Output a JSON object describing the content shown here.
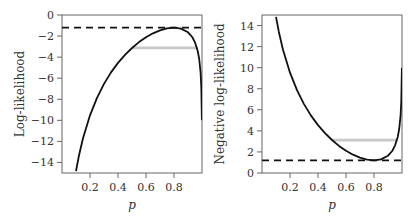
{
  "chart_data": [
    {
      "type": "line",
      "title": "",
      "xlabel": "p",
      "ylabel": "Log-likelihood",
      "xlim": [
        0,
        1
      ],
      "ylim": [
        -15,
        0
      ],
      "xticks": [
        0.2,
        0.4,
        0.6,
        0.8
      ],
      "xtick_labels": [
        "0.2",
        "0.4",
        "0.6",
        "0.8"
      ],
      "yticks": [
        0,
        -2,
        -4,
        -6,
        -8,
        -10,
        -12,
        -14
      ],
      "ytick_labels": [
        "0",
        "−2",
        "−4",
        "−6",
        "−8",
        "−10",
        "−12",
        "−14"
      ],
      "grid": false,
      "series": [
        {
          "name": "log-likelihood curve",
          "style": "solid",
          "color": "#111111",
          "x": [
            0.1,
            0.12,
            0.15,
            0.2,
            0.25,
            0.3,
            0.35,
            0.4,
            0.45,
            0.5,
            0.55,
            0.6,
            0.65,
            0.7,
            0.75,
            0.8,
            0.85,
            0.9,
            0.93,
            0.95,
            0.97,
            0.98,
            0.99,
            0.995,
            0.999
          ],
          "y": [
            -14.83,
            -13.41,
            -11.7,
            -9.52,
            -7.86,
            -6.54,
            -5.45,
            -4.55,
            -3.78,
            -3.13,
            -2.57,
            -2.11,
            -1.74,
            -1.46,
            -1.27,
            -1.2,
            -1.29,
            -1.64,
            -2.09,
            -2.6,
            -3.45,
            -4.18,
            -5.48,
            -6.83,
            -10.0
          ]
        },
        {
          "name": "maximum log-likelihood",
          "style": "dashed",
          "color": "#111111",
          "x": [
            0,
            1
          ],
          "y": [
            -1.2,
            -1.2
          ]
        },
        {
          "name": "95% interval",
          "style": "solid",
          "color": "#c8c8c8",
          "x": [
            0.5,
            0.97
          ],
          "y": [
            -3.12,
            -3.12
          ]
        }
      ]
    },
    {
      "type": "line",
      "title": "",
      "xlabel": "p",
      "ylabel": "Negative log-likelihood",
      "xlim": [
        0,
        1
      ],
      "ylim": [
        0,
        15
      ],
      "xticks": [
        0.2,
        0.4,
        0.6,
        0.8
      ],
      "xtick_labels": [
        "0.2",
        "0.4",
        "0.6",
        "0.8"
      ],
      "yticks": [
        0,
        2,
        4,
        6,
        8,
        10,
        12,
        14
      ],
      "ytick_labels": [
        "0",
        "2",
        "4",
        "6",
        "8",
        "10",
        "12",
        "14"
      ],
      "grid": false,
      "series": [
        {
          "name": "negative log-likelihood curve",
          "style": "solid",
          "color": "#111111",
          "x": [
            0.1,
            0.12,
            0.15,
            0.2,
            0.25,
            0.3,
            0.35,
            0.4,
            0.45,
            0.5,
            0.55,
            0.6,
            0.65,
            0.7,
            0.75,
            0.8,
            0.85,
            0.9,
            0.93,
            0.95,
            0.97,
            0.98,
            0.99,
            0.995,
            0.999
          ],
          "y": [
            14.83,
            13.41,
            11.7,
            9.52,
            7.86,
            6.54,
            5.45,
            4.55,
            3.78,
            3.13,
            2.57,
            2.11,
            1.74,
            1.46,
            1.27,
            1.2,
            1.29,
            1.64,
            2.09,
            2.6,
            3.45,
            4.18,
            5.48,
            6.83,
            10.0
          ]
        },
        {
          "name": "minimum negative log-likelihood",
          "style": "dashed",
          "color": "#111111",
          "x": [
            0,
            1
          ],
          "y": [
            1.2,
            1.2
          ]
        },
        {
          "name": "95% interval",
          "style": "solid",
          "color": "#c8c8c8",
          "x": [
            0.5,
            0.97
          ],
          "y": [
            3.12,
            3.12
          ]
        }
      ]
    }
  ],
  "panels": [
    {
      "ylabel": "Log-likelihood",
      "xlabel": "p"
    },
    {
      "ylabel": "Negative log-likelihood",
      "xlabel": "p"
    }
  ]
}
